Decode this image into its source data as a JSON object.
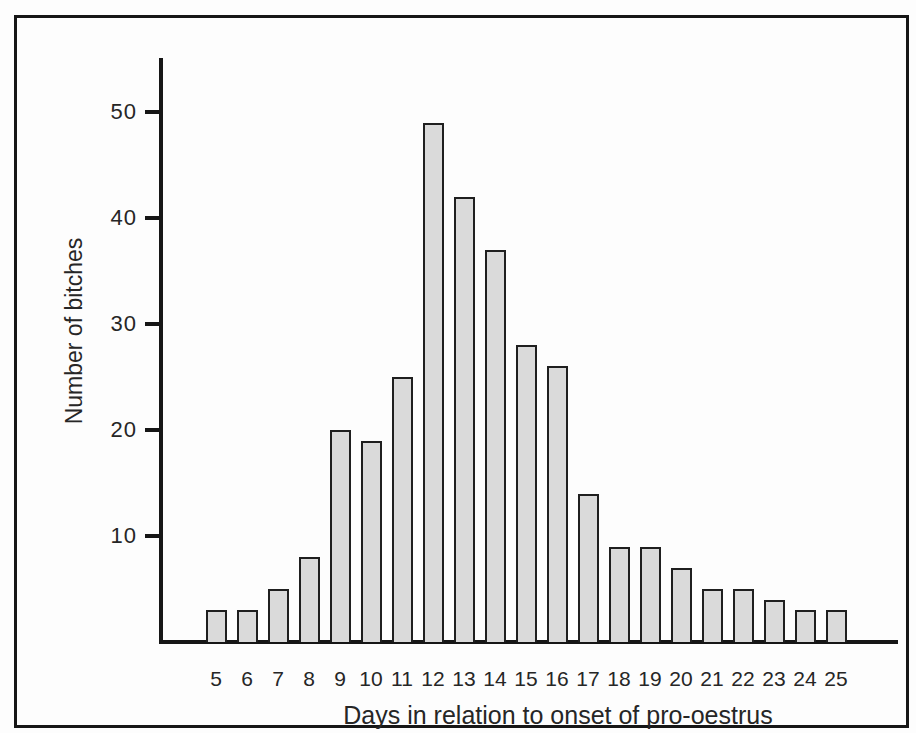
{
  "figure": {
    "x_axis_title": "Days in relation to onset of pro-oestrus",
    "y_axis_title": "Number of bitches"
  },
  "chart_data": {
    "type": "bar",
    "categories": [
      "5",
      "6",
      "7",
      "8",
      "9",
      "10",
      "11",
      "12",
      "13",
      "14",
      "15",
      "16",
      "17",
      "18",
      "19",
      "20",
      "21",
      "22",
      "23",
      "24",
      "25"
    ],
    "values": [
      3,
      3,
      5,
      8,
      20,
      19,
      25,
      49,
      42,
      37,
      28,
      26,
      14,
      9,
      9,
      7,
      5,
      5,
      4,
      3,
      3
    ],
    "title": "",
    "xlabel": "Days in relation to onset of pro-oestrus",
    "ylabel": "Number of bitches",
    "ylim": [
      0,
      55
    ],
    "yticks": [
      10,
      20,
      30,
      40,
      50
    ],
    "grid": "off",
    "legend": "none",
    "colors": {
      "bar_fill": "#dadada",
      "bar_border": "#1f1f1f",
      "axis": "#161616",
      "text": "#262626",
      "background": "#fdfdfd"
    }
  }
}
